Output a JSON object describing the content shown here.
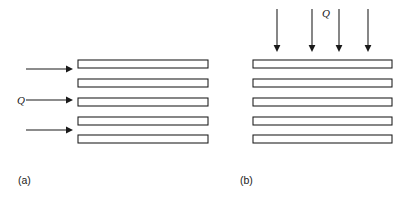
{
  "figure": {
    "type": "technical-line-diagram",
    "background_color": "#ffffff",
    "ink_color": "#1a1a1a",
    "width": 407,
    "height": 202,
    "panels": [
      {
        "id": "a",
        "label": "(a)",
        "label_x": 18,
        "label_y": 184,
        "flow_label": "Q",
        "flow_label_x": 17,
        "flow_label_y": 104,
        "flow_direction": "horizontal-left-to-right",
        "arrow_count": 3,
        "arrows": [
          {
            "x1": 26,
            "y1": 69,
            "x2": 71,
            "y2": 69
          },
          {
            "x1": 26,
            "y1": 100,
            "x2": 71,
            "y2": 100
          },
          {
            "x1": 26,
            "y1": 130,
            "x2": 71,
            "y2": 130
          }
        ],
        "plate_count": 5,
        "plate_x": 78,
        "plate_width": 130,
        "plate_height": 8,
        "plates": [
          {
            "y": 60
          },
          {
            "y": 79
          },
          {
            "y": 98
          },
          {
            "y": 117
          },
          {
            "y": 135
          }
        ]
      },
      {
        "id": "b",
        "label": "(b)",
        "label_x": 240,
        "label_y": 184,
        "flow_label": "Q",
        "flow_label_x": 322,
        "flow_label_y": 17,
        "flow_direction": "vertical-top-to-bottom",
        "arrow_count": 4,
        "arrows": [
          {
            "x1": 277,
            "y1": 9,
            "x2": 277,
            "y2": 50
          },
          {
            "x1": 312,
            "y1": 9,
            "x2": 312,
            "y2": 50
          },
          {
            "x1": 339,
            "y1": 9,
            "x2": 339,
            "y2": 50
          },
          {
            "x1": 368,
            "y1": 9,
            "x2": 368,
            "y2": 50
          }
        ],
        "plate_count": 5,
        "plate_x": 253,
        "plate_width": 139,
        "plate_height": 8,
        "plates": [
          {
            "y": 60
          },
          {
            "y": 79
          },
          {
            "y": 98
          },
          {
            "y": 117
          },
          {
            "y": 135
          }
        ]
      }
    ]
  }
}
